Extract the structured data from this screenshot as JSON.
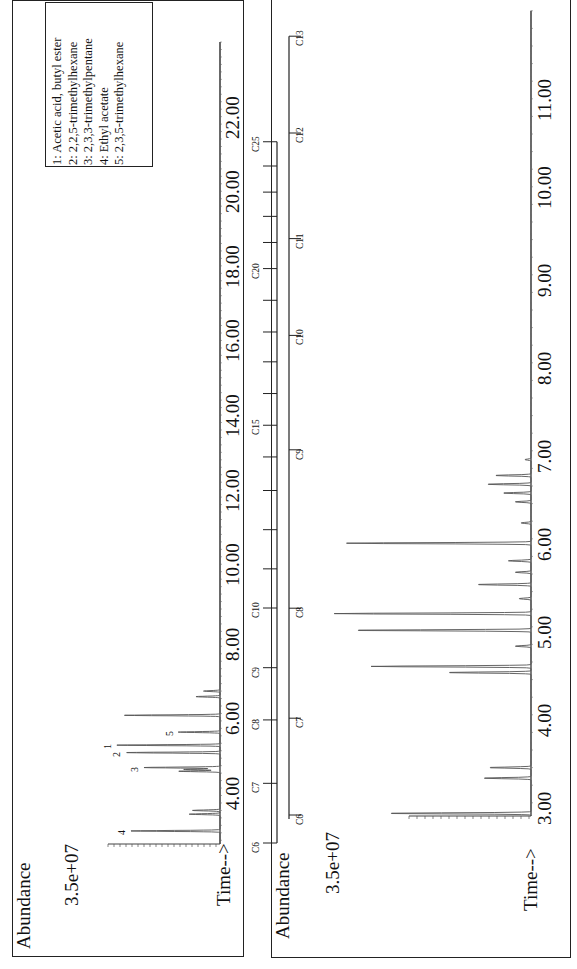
{
  "page": {
    "orientation": "rotated 90 degrees counter-clockwise"
  },
  "panels": [
    {
      "id": "top",
      "y_label": "Abundance",
      "y_tick_label": "3.5e+07",
      "x_label": "Time-->",
      "x_ticks": [
        "4.00",
        "6.00",
        "8.00",
        "10.00",
        "12.00",
        "14.00",
        "16.00",
        "18.00",
        "20.00",
        "22.00"
      ],
      "legend": [
        "1:  Acetic acid, butyl ester",
        "2:  2,2,5-trimethylhexane",
        "3:  2,3,3-trimethylpentane",
        "4:  Ethyl acetate",
        "5:  2,3,5-trimethylhexane"
      ],
      "carbon_scale": {
        "labels": [
          "C6",
          "C7",
          "C8",
          "C9",
          "C10",
          "C15",
          "C20",
          "C25"
        ],
        "label_times": [
          2.5,
          4.1,
          5.8,
          7.2,
          8.8,
          13.7,
          17.9,
          21.3
        ]
      },
      "peak_labels": [
        "1",
        "2",
        "3",
        "4",
        "5"
      ]
    },
    {
      "id": "bottom",
      "y_label": "Abundance",
      "y_tick_label": "3.5e+07",
      "x_label": "Time-->",
      "x_ticks": [
        "3.00",
        "4.00",
        "5.00",
        "6.00",
        "7.00",
        "8.00",
        "9.00",
        "10.00",
        "11.00"
      ],
      "carbon_scale": {
        "labels": [
          "C6",
          "C7",
          "C8",
          "C9",
          "C10",
          "C11",
          "C12",
          "C13"
        ],
        "label_times": [
          2.85,
          3.95,
          5.2,
          7.0,
          8.3,
          9.4,
          10.6,
          11.7
        ]
      }
    }
  ],
  "chart_data": [
    {
      "type": "line",
      "title": "GC-MS total ion chromatogram (full run)",
      "xlabel": "Time-->",
      "ylabel": "Abundance",
      "xlim": [
        2.5,
        24.0
      ],
      "y_tick": "3.5e+07",
      "x_ticks": [
        4,
        6,
        8,
        10,
        12,
        14,
        16,
        18,
        20,
        22
      ],
      "legend": [
        "1: Acetic acid, butyl ester",
        "2: 2,2,5-trimethylhexane",
        "3: 2,3,3-trimethylpentane",
        "4: Ethyl acetate",
        "5: 2,3,5-trimethylhexane"
      ],
      "legend_position": "upper right",
      "grid": false,
      "peaks": [
        {
          "time": 2.85,
          "rel_height": 0.82,
          "label": "4"
        },
        {
          "time": 3.3,
          "rel_height": 0.28
        },
        {
          "time": 3.4,
          "rel_height": 0.25
        },
        {
          "time": 4.45,
          "rel_height": 0.38
        },
        {
          "time": 4.5,
          "rel_height": 0.33
        },
        {
          "time": 4.55,
          "rel_height": 0.7,
          "label": "3"
        },
        {
          "time": 4.95,
          "rel_height": 0.86,
          "label": "2"
        },
        {
          "time": 5.15,
          "rel_height": 0.95,
          "label": "1"
        },
        {
          "time": 5.5,
          "rel_height": 0.38,
          "label": "5"
        },
        {
          "time": 5.95,
          "rel_height": 0.88
        },
        {
          "time": 6.45,
          "rel_height": 0.22
        },
        {
          "time": 6.6,
          "rel_height": 0.15
        }
      ],
      "carbon_markers": {
        "C6": 2.5,
        "C7": 4.1,
        "C8": 5.8,
        "C9": 7.2,
        "C10": 8.8,
        "C15": 13.7,
        "C20": 17.9,
        "C25": 21.3
      }
    },
    {
      "type": "line",
      "title": "GC-MS total ion chromatogram (expanded 2.8-12 min)",
      "xlabel": "Time-->",
      "ylabel": "Abundance",
      "xlim": [
        2.85,
        12.0
      ],
      "y_tick": "3.5e+07",
      "x_ticks": [
        3,
        4,
        5,
        6,
        7,
        8,
        9,
        10,
        11
      ],
      "grid": false,
      "peaks": [
        {
          "time": 2.88,
          "rel_height": 0.72
        },
        {
          "time": 3.28,
          "rel_height": 0.24
        },
        {
          "time": 3.4,
          "rel_height": 0.21
        },
        {
          "time": 4.48,
          "rel_height": 0.42
        },
        {
          "time": 4.55,
          "rel_height": 0.78
        },
        {
          "time": 4.78,
          "rel_height": 0.08
        },
        {
          "time": 4.96,
          "rel_height": 0.89
        },
        {
          "time": 5.15,
          "rel_height": 0.96
        },
        {
          "time": 5.32,
          "rel_height": 0.06
        },
        {
          "time": 5.48,
          "rel_height": 0.27
        },
        {
          "time": 5.62,
          "rel_height": 0.08
        },
        {
          "time": 5.75,
          "rel_height": 0.11
        },
        {
          "time": 5.95,
          "rel_height": 0.9
        },
        {
          "time": 6.18,
          "rel_height": 0.05
        },
        {
          "time": 6.42,
          "rel_height": 0.08
        },
        {
          "time": 6.52,
          "rel_height": 0.14
        },
        {
          "time": 6.62,
          "rel_height": 0.22
        },
        {
          "time": 6.72,
          "rel_height": 0.18
        },
        {
          "time": 6.9,
          "rel_height": 0.03
        }
      ],
      "carbon_markers": {
        "C6": 2.85,
        "C7": 3.95,
        "C8": 5.2,
        "C9": 7.0,
        "C10": 8.3,
        "C11": 9.4,
        "C12": 10.6,
        "C13": 11.7
      }
    }
  ]
}
